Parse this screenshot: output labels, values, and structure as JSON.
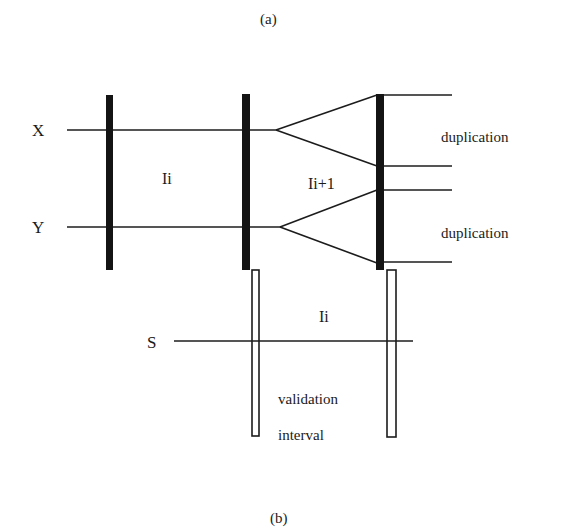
{
  "captions": {
    "top": "(a)",
    "bottom": "(b)"
  },
  "signals": {
    "x": "X",
    "y": "Y",
    "s": "S"
  },
  "intervals": {
    "first": "Ii",
    "second": "Ii+1",
    "validation_region": "Ii"
  },
  "annotations": {
    "duplication_top": "duplication",
    "duplication_bottom": "duplication",
    "validation_line1": "validation",
    "validation_line2": "interval"
  },
  "colors": {
    "ink": "#141414",
    "background": "#ffffff"
  }
}
